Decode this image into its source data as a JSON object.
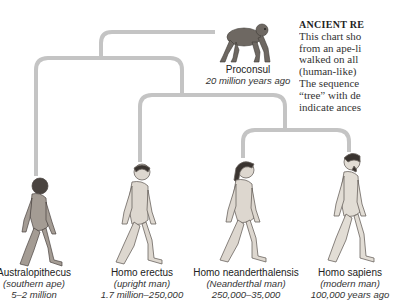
{
  "top_cutoff_text": "...",
  "sidebar": {
    "heading": "ANCIENT RE",
    "lines": [
      "This chart sho",
      "from an ape-li",
      "walked on all",
      "(human-like)",
      "The sequence",
      "“tree” with de",
      "indicate ances"
    ]
  },
  "ancestor": {
    "name": "Proconsul",
    "date": "20 million years ago"
  },
  "species": [
    {
      "name": "Australopithecus",
      "common": "(southern ape)",
      "date": "5–2 million"
    },
    {
      "name": "Homo erectus",
      "common": "(upright man)",
      "date": "1.7 million–250,000"
    },
    {
      "name": "Homo neanderthalensis",
      "common": "(Neanderthal man)",
      "date": "250,000–35,000"
    },
    {
      "name": "Homo sapiens",
      "common": "(modern man)",
      "date": "100,000 years ago"
    }
  ],
  "colors": {
    "tree_line": "#c4c4c4",
    "figure_skin": "#d9d4cc",
    "figure_shade": "#6b6560",
    "hair": "#3a3430"
  }
}
